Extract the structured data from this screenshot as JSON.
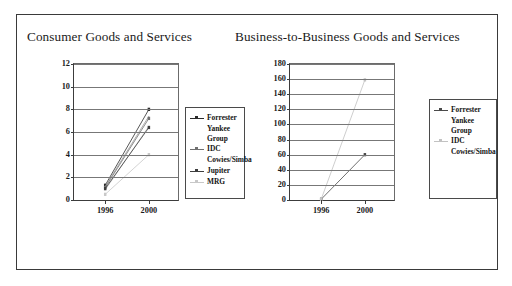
{
  "figure": {
    "panels": [
      {
        "id": "consumer",
        "title": "Consumer Goods and Services"
      },
      {
        "id": "b2b",
        "title": "Business-to-Business  Goods and Services"
      }
    ]
  },
  "chart_data": [
    {
      "type": "line",
      "title": "Consumer Goods and Services",
      "xlabel": "",
      "ylabel": "",
      "x": [
        "1996",
        "2000"
      ],
      "xlim": [
        0,
        1
      ],
      "ylim": [
        0,
        12
      ],
      "yticks": [
        0,
        2,
        4,
        6,
        8,
        10,
        12
      ],
      "ytick_labels": [
        "0",
        "2",
        "4",
        "6",
        "8",
        "10",
        "12"
      ],
      "xtick_labels": [
        "1996",
        "2000"
      ],
      "grid": true,
      "legend_position": "right",
      "series": [
        {
          "name": "Forrester",
          "values": [
            1.3,
            8.0
          ],
          "color": "#2b2b2b",
          "marker": "square"
        },
        {
          "name": "Yankee Group",
          "values": [
            1.2,
            7.4
          ],
          "color": "#9a9a9a",
          "marker": "none"
        },
        {
          "name": "IDC",
          "values": [
            1.1,
            7.2
          ],
          "color": "#707070",
          "marker": "square"
        },
        {
          "name": "Cowies/Simba",
          "values": [
            0.9,
            6.5
          ],
          "color": "#b4b4b4",
          "marker": "none"
        },
        {
          "name": "Jupiter",
          "values": [
            1.0,
            6.4
          ],
          "color": "#3d3d3d",
          "marker": "square"
        },
        {
          "name": "MRG",
          "values": [
            0.5,
            4.0
          ],
          "color": "#c8c8c8",
          "marker": "square"
        }
      ]
    },
    {
      "type": "line",
      "title": "Business-to-Business  Goods and Services",
      "xlabel": "",
      "ylabel": "",
      "x": [
        "1996",
        "2000"
      ],
      "xlim": [
        0,
        1
      ],
      "ylim": [
        0,
        180
      ],
      "yticks": [
        0,
        20,
        40,
        60,
        80,
        100,
        120,
        140,
        160,
        180
      ],
      "ytick_labels": [
        "0",
        "20",
        "40",
        "60",
        "80",
        "100",
        "120",
        "140",
        "160",
        "180"
      ],
      "xtick_labels": [
        "1996",
        "2000"
      ],
      "grid": true,
      "legend_position": "right",
      "series": [
        {
          "name": "Forrester",
          "values": [
            1,
            60
          ],
          "color": "#4a4a4a",
          "marker": "square"
        },
        {
          "name": "Yankee\nGroup",
          "values": [
            0,
            0
          ],
          "color": "#b0b0b0",
          "marker": "none"
        },
        {
          "name": "IDC",
          "values": [
            1,
            159
          ],
          "color": "#c2c2c2",
          "marker": "square"
        },
        {
          "name": "Cowies/Simba",
          "values": [
            0,
            0
          ],
          "color": "#cfcfcf",
          "marker": "none"
        }
      ]
    }
  ]
}
